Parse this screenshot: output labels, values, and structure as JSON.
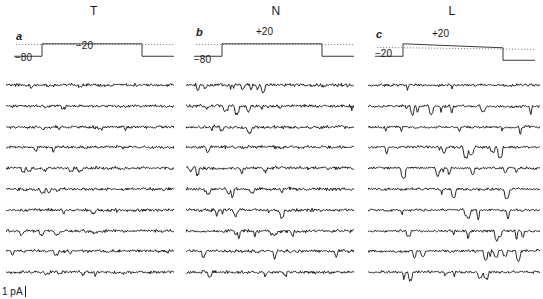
{
  "figure": {
    "background_color": "#ffffff",
    "trace_color": "#000000",
    "protocol_color": "#3a3a3a",
    "dotted_line_color": "#8a8a8a",
    "width": 543,
    "height": 299,
    "scale_bar": {
      "label": "1 pA",
      "icon": "vertical-scale-bar-icon"
    }
  },
  "panels": [
    {
      "letter": "a",
      "title": "T",
      "holding_label": "−80",
      "step_label": "−20",
      "holding_mV": -80,
      "step_mV": -20,
      "n_traces": 10,
      "title_x": 94,
      "letter_x": 16,
      "letter_y": 30,
      "proto_x": 14,
      "proto_w": 160,
      "traces_x": 6,
      "traces_w": 168,
      "holding_label_x": 15,
      "holding_label_y": 52,
      "step_label_x": 76,
      "step_label_y": 40
    },
    {
      "letter": "b",
      "title": "N",
      "holding_label": "−80",
      "step_label": "+20",
      "holding_mV": -80,
      "step_mV": 20,
      "n_traces": 10,
      "title_x": 276,
      "letter_x": 196,
      "letter_y": 26,
      "proto_x": 194,
      "proto_w": 160,
      "traces_x": 186,
      "traces_w": 168,
      "holding_label_x": 194,
      "holding_label_y": 54,
      "step_label_x": 256,
      "step_label_y": 26
    },
    {
      "letter": "c",
      "title": "L",
      "holding_label": "−20",
      "step_label": "+20",
      "holding_mV": -20,
      "step_mV": 20,
      "n_traces": 10,
      "title_x": 452,
      "letter_x": 376,
      "letter_y": 28,
      "proto_x": 375,
      "proto_w": 160,
      "traces_x": 368,
      "traces_w": 172,
      "holding_label_x": 375,
      "holding_label_y": 48,
      "step_label_x": 432,
      "step_label_y": 28
    }
  ],
  "chart_data": {
    "type": "line",
    "title": "",
    "xlabel": "",
    "ylabel": "",
    "y_scale_bar_pA": 1,
    "series": [
      {
        "name": "T",
        "panel": "a",
        "command_holding_mV": -80,
        "command_step_mV": -20,
        "n_sweeps": 10,
        "noise_amplitude": 2.0,
        "event_rate": 0.3,
        "event_depth": 4.0,
        "burst_window": [
          0.08,
          0.55
        ],
        "seed": 11
      },
      {
        "name": "N",
        "panel": "b",
        "command_holding_mV": -80,
        "command_step_mV": 20,
        "n_sweeps": 10,
        "noise_amplitude": 2.2,
        "event_rate": 0.34,
        "event_depth": 6.5,
        "burst_window": [
          0.05,
          0.62
        ],
        "seed": 27
      },
      {
        "name": "L",
        "panel": "c",
        "command_holding_mV": -20,
        "command_step_mV": 20,
        "n_sweeps": 10,
        "noise_amplitude": 1.8,
        "event_rate": 0.26,
        "event_depth": 9.0,
        "burst_window": [
          0.1,
          0.88
        ],
        "seed": 43
      }
    ],
    "axis_ranges": {
      "x": [
        0,
        1
      ],
      "y": [
        -12,
        4
      ]
    },
    "grid": false,
    "legend": "none"
  },
  "layout": {
    "trace_top": 80,
    "trace_spacing": 20.8,
    "trace_height": 17,
    "protocol_top": 36,
    "protocol_height": 26
  }
}
